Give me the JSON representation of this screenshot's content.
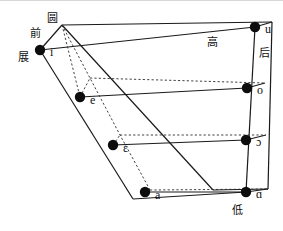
{
  "figure": {
    "name": "vowel-quadrilateral",
    "width": 283,
    "height": 231,
    "stroke_color": "#1a1a1a",
    "dot_color": "#0d0d0d",
    "background": "#ffffff"
  },
  "axis_labels": {
    "front": "前",
    "back": "后",
    "high": "高",
    "low": "低",
    "rounded": "圆",
    "spread": "展"
  },
  "vowels": [
    {
      "symbol": "i",
      "x": 40,
      "y": 50,
      "label_dx": 10,
      "label_dy": 3,
      "side": "front-unrounded"
    },
    {
      "symbol": "u",
      "x": 255,
      "y": 27,
      "label_dx": 10,
      "label_dy": 3,
      "side": "back-rounded"
    },
    {
      "symbol": "e",
      "x": 80,
      "y": 97,
      "label_dx": 10,
      "label_dy": 4,
      "side": "front-unrounded"
    },
    {
      "symbol": "o",
      "x": 247,
      "y": 88,
      "label_dx": 10,
      "label_dy": 3,
      "side": "back-rounded"
    },
    {
      "symbol": "ɛ",
      "x": 113,
      "y": 145,
      "label_dx": 10,
      "label_dy": 4,
      "side": "front-unrounded"
    },
    {
      "symbol": "ɔ",
      "x": 246,
      "y": 140,
      "label_dx": 10,
      "label_dy": 3,
      "side": "back-rounded"
    },
    {
      "symbol": "a",
      "x": 145,
      "y": 192,
      "label_dx": 10,
      "label_dy": 4,
      "side": "front-unrounded"
    },
    {
      "symbol": "ɑ",
      "x": 246,
      "y": 192,
      "label_dx": 10,
      "label_dy": 3,
      "side": "back-unrounded"
    }
  ],
  "chart_data": {
    "type": "scatter",
    "xlabel": "前 / 后",
    "ylabel": "高 / 低",
    "annotations": [
      "前",
      "后",
      "高",
      "低",
      "圆",
      "展"
    ],
    "points": [
      {
        "label": "i",
        "height": "高",
        "backness": "前",
        "rounding": "展"
      },
      {
        "label": "u",
        "height": "高",
        "backness": "后",
        "rounding": "圆"
      },
      {
        "label": "e",
        "height": "半高",
        "backness": "前",
        "rounding": "展"
      },
      {
        "label": "o",
        "height": "半高",
        "backness": "后",
        "rounding": "圆"
      },
      {
        "label": "ɛ",
        "height": "半低",
        "backness": "前",
        "rounding": "展"
      },
      {
        "label": "ɔ",
        "height": "半低",
        "backness": "后",
        "rounding": "圆"
      },
      {
        "label": "a",
        "height": "低",
        "backness": "前",
        "rounding": "展"
      },
      {
        "label": "ɑ",
        "height": "低",
        "backness": "后",
        "rounding": "展"
      }
    ]
  }
}
